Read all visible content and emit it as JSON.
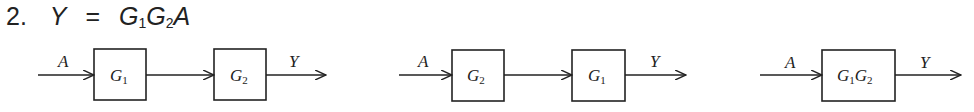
{
  "problem": {
    "number": "2.",
    "equation": {
      "lhs": "Y",
      "eq": "=",
      "rhs_terms": [
        {
          "base": "G",
          "sub": "1"
        },
        {
          "base": "G",
          "sub": "2"
        },
        {
          "base": "A",
          "sub": ""
        }
      ]
    }
  },
  "diagrams": [
    {
      "input": "A",
      "output": "Y",
      "blocks": [
        {
          "base": "G",
          "sub": "1"
        },
        {
          "base": "G",
          "sub": "2"
        }
      ]
    },
    {
      "input": "A",
      "output": "Y",
      "blocks": [
        {
          "base": "G",
          "sub": "2"
        },
        {
          "base": "G",
          "sub": "1"
        }
      ]
    },
    {
      "input": "A",
      "output": "Y",
      "blocks": [
        {
          "base": "G",
          "sub": "1",
          "base2": "G",
          "sub2": "2"
        }
      ]
    }
  ]
}
